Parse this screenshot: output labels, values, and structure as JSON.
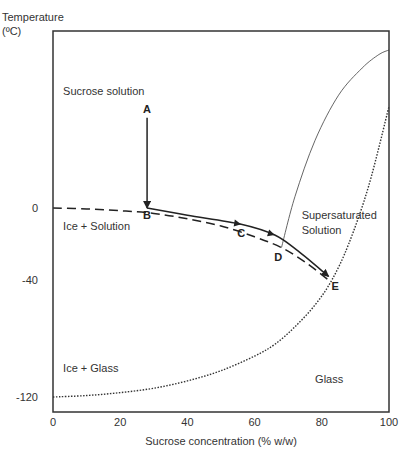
{
  "chart_data": {
    "type": "line",
    "title": "",
    "xlabel": "Sucrose concentration (% w/w)",
    "ylabel": "Temperature (ºC)",
    "ylabel_line1": "Temperature",
    "ylabel_line2": "(ºC)",
    "xlim": [
      0,
      100
    ],
    "ylim": [
      -120,
      60
    ],
    "x_ticks": [
      "0",
      "20",
      "40",
      "60",
      "80",
      "100"
    ],
    "x_tick_values": [
      0,
      20,
      40,
      60,
      80,
      100
    ],
    "y_ticks": [
      "0",
      "-40",
      "-120"
    ],
    "y_tick_values": [
      0,
      -40,
      -120
    ],
    "grid": false,
    "series": [
      {
        "name": "Freezing curve (liquidus)",
        "style": "dashed",
        "x": [
          0,
          10,
          20,
          30,
          40,
          50,
          60,
          68,
          75,
          82
        ],
        "y": [
          0,
          -0.5,
          -1.5,
          -3,
          -6,
          -10,
          -16,
          -22,
          -30,
          -40
        ]
      },
      {
        "name": "Solubility curve",
        "style": "solid-thin",
        "x": [
          68,
          72,
          78,
          85,
          92,
          97,
          100
        ],
        "y": [
          -22,
          5,
          30,
          50,
          62,
          68,
          70
        ]
      },
      {
        "name": "Glass transition curve",
        "style": "dotted",
        "x": [
          0,
          10,
          20,
          30,
          40,
          50,
          60,
          66,
          72,
          78,
          83,
          88,
          94,
          100
        ],
        "y": [
          -120,
          -119,
          -117,
          -114,
          -109,
          -102,
          -92,
          -84,
          -72,
          -57,
          -40,
          -20,
          10,
          45
        ]
      },
      {
        "name": "Path A-B",
        "style": "arrow",
        "x": [
          28,
          28
        ],
        "y": [
          40,
          0
        ]
      },
      {
        "name": "Path B-E",
        "style": "arrow",
        "x": [
          28,
          40,
          56,
          66,
          73,
          82
        ],
        "y": [
          0,
          -4,
          -9,
          -15,
          -24,
          -38
        ]
      }
    ],
    "annotations": [
      {
        "text": "A",
        "x": 28,
        "y": 44
      },
      {
        "text": "B",
        "x": 28,
        "y": -4
      },
      {
        "text": "C",
        "x": 56,
        "y": -14
      },
      {
        "text": "D",
        "x": 67,
        "y": -27
      },
      {
        "text": "E",
        "x": 84,
        "y": -44
      }
    ],
    "region_labels": [
      {
        "text": "Sucrose solution",
        "x": 3,
        "y": 52
      },
      {
        "text": "Ice + Solution",
        "x": 3,
        "y": -10
      },
      {
        "text": "Supersaturated",
        "x": 74,
        "y": -4
      },
      {
        "text": "Solution",
        "x": 74,
        "y": -12
      },
      {
        "text": "Ice + Glass",
        "x": 3,
        "y": -100
      },
      {
        "text": "Glass",
        "x": 78,
        "y": -108
      }
    ]
  }
}
